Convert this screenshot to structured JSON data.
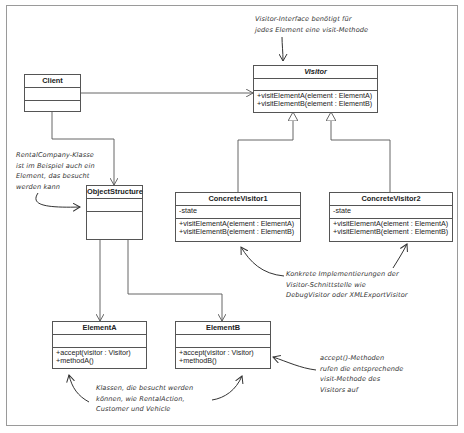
{
  "diagram": {
    "classes": {
      "client": {
        "name": "Client",
        "attributes": [],
        "methods": []
      },
      "object_structure": {
        "name": "ObjectStructure",
        "attributes": [],
        "methods": []
      },
      "visitor": {
        "name": "Visitor",
        "abstract": true,
        "attributes": [],
        "methods": [
          "+visitElementA(element : ElementA)",
          "+visitElementB(element : ElementB)"
        ]
      },
      "concrete_visitor1": {
        "name": "ConcreteVisitor1",
        "attributes": [
          "-state"
        ],
        "methods": [
          "+visitElementA(element : ElementA)",
          "+visitElementB(element : ElementB)"
        ]
      },
      "concrete_visitor2": {
        "name": "ConcreteVisitor2",
        "attributes": [
          "-state"
        ],
        "methods": [
          "+visitElementA(element : ElementA)",
          "+visitElementB(element : ElementB)"
        ]
      },
      "element_a": {
        "name": "ElementA",
        "attributes": [],
        "methods": [
          "+accept(visitor : Visitor)",
          "+methodA()"
        ]
      },
      "element_b": {
        "name": "ElementB",
        "attributes": [],
        "methods": [
          "+accept(visitor : Visitor)",
          "+methodB()"
        ]
      }
    },
    "relations": [
      {
        "from": "Client",
        "to": "Visitor",
        "type": "association"
      },
      {
        "from": "Client",
        "to": "ObjectStructure",
        "type": "association"
      },
      {
        "from": "ConcreteVisitor1",
        "to": "Visitor",
        "type": "realization"
      },
      {
        "from": "ConcreteVisitor2",
        "to": "Visitor",
        "type": "realization"
      },
      {
        "from": "ObjectStructure",
        "to": "ElementA",
        "type": "association"
      },
      {
        "from": "ObjectStructure",
        "to": "ElementB",
        "type": "association"
      }
    ],
    "notes": {
      "visitor_interface": [
        "Visitor-Interface benötigt für",
        "jedes Element eine visit-Methode"
      ],
      "rental_company": [
        "RentalCompany-Klasse",
        "ist im Beispiel auch ein",
        "Element, das besucht",
        "werden kann"
      ],
      "concrete_impl": [
        "Konkrete Implementierungen der",
        "Visitor-Schnittstelle wie",
        "DebugVisitor oder XMLExportVisitor"
      ],
      "accept_methods": [
        "accept()-Methoden",
        "rufen die entsprechende",
        "visit-Methode des",
        "Visitors auf"
      ],
      "visitable_classes": [
        "Klassen, die besucht werden",
        "können, wie RentalAction,",
        "Customer und Vehicle"
      ]
    }
  }
}
